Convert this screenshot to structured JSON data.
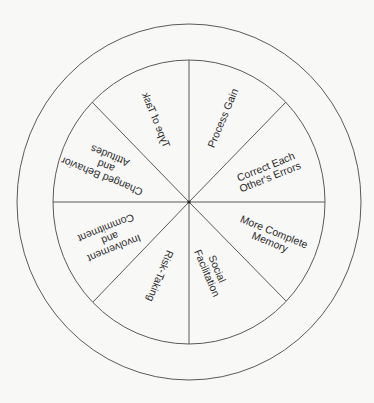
{
  "diagram": {
    "type": "wheel",
    "center": {
      "x": 189,
      "y": 202
    },
    "outer_ring": {
      "rx": 172,
      "ry": 178
    },
    "inner_circle": {
      "rx": 136,
      "ry": 142
    },
    "line_color": "#5a5a5a",
    "text_color": "#2a2a2a",
    "segments": [
      {
        "id": "process-gain",
        "lines": [
          "Process Gain"
        ],
        "x": 223,
        "y": 118,
        "rotate": -67,
        "mirror": false
      },
      {
        "id": "correct-errors",
        "lines": [
          "Correct Each",
          "Other's Errors"
        ],
        "x": 268,
        "y": 172,
        "rotate": -22,
        "mirror": false
      },
      {
        "id": "more-complete-memory",
        "lines": [
          "More Complete",
          "Memory"
        ],
        "x": 272,
        "y": 237,
        "rotate": 22,
        "mirror": false
      },
      {
        "id": "social-facilitation",
        "lines": [
          "Social",
          "Facilitation"
        ],
        "x": 212,
        "y": 271,
        "rotate": 67,
        "mirror": false
      },
      {
        "id": "risk-taking",
        "lines": [
          "Risk-Taking"
        ],
        "x": 160,
        "y": 276,
        "rotate": 112,
        "mirror": false
      },
      {
        "id": "involvement-commitment",
        "lines": [
          "Involvement",
          "and",
          "Commitment"
        ],
        "x": 110,
        "y": 238,
        "rotate": 158,
        "mirror": false
      },
      {
        "id": "changed-behavior",
        "lines": [
          "Changed Behavior",
          "and",
          "Attitudes"
        ],
        "x": 106,
        "y": 166,
        "rotate": 202,
        "mirror": false
      },
      {
        "id": "type-of-task",
        "lines": [
          "Type of Task"
        ],
        "x": 156,
        "y": 120,
        "rotate": 248,
        "mirror": true
      }
    ]
  }
}
